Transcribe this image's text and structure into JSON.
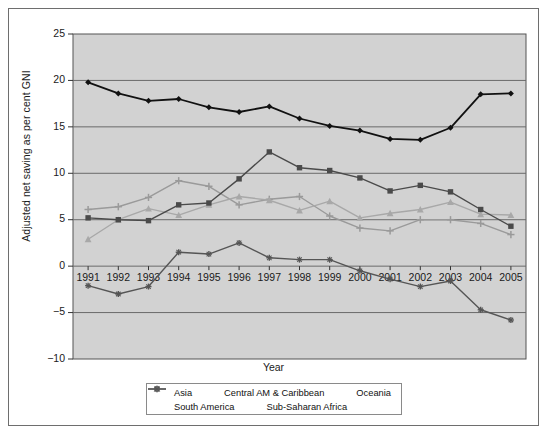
{
  "chart_data": {
    "type": "line",
    "title": "",
    "xlabel": "Year",
    "ylabel": "Adjusted net saving as per cent GNI",
    "categories": [
      "1991",
      "1992",
      "1993",
      "1994",
      "1995",
      "1996",
      "1997",
      "1998",
      "1999",
      "2000",
      "2001",
      "2002",
      "2003",
      "2004",
      "2005"
    ],
    "x": [
      1991,
      1992,
      1993,
      1994,
      1995,
      1996,
      1997,
      1998,
      1999,
      2000,
      2001,
      2002,
      2003,
      2004,
      2005
    ],
    "ylim": [
      -10,
      25
    ],
    "yticks": [
      "25",
      "20",
      "15",
      "10",
      "5",
      "0",
      "-5",
      "-10"
    ],
    "ytick_values": [
      25,
      20,
      15,
      10,
      5,
      0,
      -5,
      -10
    ],
    "grid": "horizontal",
    "legend_position": "bottom",
    "plot_background": "#d2d2d2",
    "series": [
      {
        "name": "Asia",
        "marker": "diamond",
        "color": "#111111",
        "values": [
          19.8,
          18.6,
          17.8,
          18.0,
          17.1,
          16.6,
          17.2,
          15.9,
          15.1,
          14.6,
          13.7,
          13.6,
          14.9,
          18.5,
          18.6
        ]
      },
      {
        "name": "Central AM & Caribbean",
        "marker": "square",
        "color": "#4a4a4a",
        "values": [
          5.2,
          5.0,
          4.9,
          6.6,
          6.8,
          9.4,
          12.3,
          10.6,
          10.3,
          9.5,
          8.1,
          8.7,
          8.0,
          6.1,
          4.3
        ]
      },
      {
        "name": "Oceania",
        "marker": "triangle",
        "color": "#a8a8a8",
        "values": [
          2.9,
          5.0,
          6.2,
          5.5,
          6.6,
          7.5,
          7.1,
          6.0,
          7.0,
          5.2,
          5.7,
          6.1,
          6.9,
          5.6,
          5.5
        ]
      },
      {
        "name": "South America",
        "marker": "plus",
        "color": "#9a9a9a",
        "values": [
          6.1,
          6.4,
          7.4,
          9.2,
          8.6,
          6.6,
          7.2,
          7.5,
          5.4,
          4.1,
          3.8,
          5.0,
          5.0,
          4.6,
          3.4
        ]
      },
      {
        "name": "Sub-Saharan Africa",
        "marker": "star",
        "color": "#555555",
        "values": [
          -2.1,
          -3.0,
          -2.2,
          1.5,
          1.3,
          2.5,
          0.9,
          0.7,
          0.7,
          -0.5,
          -1.4,
          -2.2,
          -1.6,
          -4.7,
          -5.8
        ]
      }
    ]
  },
  "axes": {
    "y_title": "Adjusted net saving as per cent GNI",
    "x_title": "Year"
  },
  "legend": {
    "rows": [
      [
        "Asia",
        "Central AM & Caribbean",
        "Oceania"
      ],
      [
        "South America",
        "Sub-Saharan Africa"
      ]
    ]
  }
}
